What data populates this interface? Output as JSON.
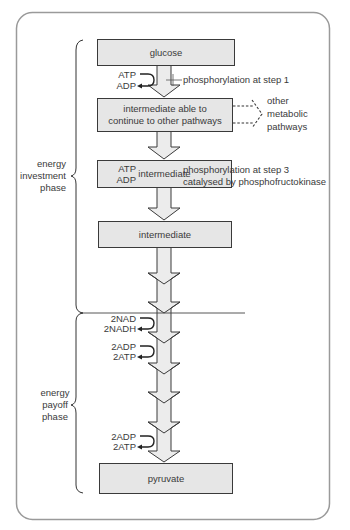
{
  "diagram": {
    "title": "",
    "boxes": [
      {
        "id": "glucose",
        "label": "glucose"
      },
      {
        "id": "intermediate-1",
        "label": "intermediate able to continue to other pathways"
      },
      {
        "id": "intermediate-2",
        "label": "intermediate"
      },
      {
        "id": "intermediate-3",
        "label": "intermediate"
      },
      {
        "id": "pyruvate",
        "label": "pyruvate"
      }
    ],
    "annotations": {
      "step1": {
        "in": "ATP",
        "out": "ADP",
        "note": "phosphorylation at step 1"
      },
      "step3": {
        "in": "ATP",
        "out": "ADP",
        "note_line1": "phosphorylation at step 3",
        "note_line2": "catalysed by phosphofructokinase"
      },
      "nad": {
        "in": "2NAD",
        "out": "2NADH"
      },
      "adp1": {
        "in": "2ADP",
        "out": "2ATP"
      },
      "adp2": {
        "in": "2ADP",
        "out": "2ATP"
      },
      "other_pathways": {
        "line1": "other",
        "line2": "metabolic",
        "line3": "pathways"
      }
    },
    "phases": {
      "investment": {
        "line1": "energy",
        "line2": "investment",
        "line3": "phase"
      },
      "payoff": {
        "line1": "energy",
        "line2": "payoff",
        "line3": "phase"
      }
    },
    "colors": {
      "box_fill": "#e6e6e6",
      "arrow_fill": "#ececec",
      "stroke": "#3a3a3a",
      "frame": "#999999"
    }
  }
}
